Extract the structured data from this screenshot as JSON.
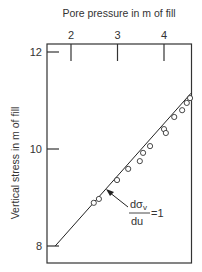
{
  "chart_data": {
    "type": "scatter",
    "title": "",
    "xlabel": "Pore pressure in m of fill",
    "ylabel": "Vertical stress in m of fill",
    "x_axis_position": "top",
    "xlim": [
      1.66,
      4.58
    ],
    "ylim": [
      7.6,
      12.15
    ],
    "xticks": [
      2,
      3,
      4
    ],
    "xtick_labels": [
      "2",
      "3",
      "4"
    ],
    "yticks": [
      8,
      10,
      12
    ],
    "ytick_labels": [
      "8",
      "10",
      "12"
    ],
    "grid": false,
    "series": [
      {
        "name": "observations",
        "marker": "open-circle",
        "points": [
          {
            "x": 2.49,
            "y": 8.89
          },
          {
            "x": 2.6,
            "y": 8.97
          },
          {
            "x": 2.99,
            "y": 9.36
          },
          {
            "x": 3.23,
            "y": 9.59
          },
          {
            "x": 3.48,
            "y": 9.75
          },
          {
            "x": 3.55,
            "y": 9.92
          },
          {
            "x": 3.7,
            "y": 10.06
          },
          {
            "x": 4.0,
            "y": 10.41
          },
          {
            "x": 4.04,
            "y": 10.33
          },
          {
            "x": 4.22,
            "y": 10.66
          },
          {
            "x": 4.39,
            "y": 10.8
          },
          {
            "x": 4.49,
            "y": 10.95
          },
          {
            "x": 4.56,
            "y": 11.05
          }
        ]
      },
      {
        "name": "fit line",
        "type": "line",
        "points": [
          {
            "x": 1.66,
            "y": 8.0
          },
          {
            "x": 4.58,
            "y": 11.15
          }
        ]
      }
    ],
    "annotations": [
      {
        "numerator": "dσ",
        "numerator_subscript": "v",
        "denominator": "du",
        "suffix": "=1",
        "points_to": {
          "x": 2.77,
          "y": 9.13
        }
      }
    ]
  }
}
